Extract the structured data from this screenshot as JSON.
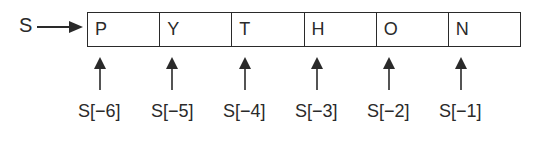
{
  "variable": {
    "name": "S"
  },
  "string_cells": [
    {
      "char": "P",
      "index_label": "S[−6]"
    },
    {
      "char": "Y",
      "index_label": "S[−5]"
    },
    {
      "char": "T",
      "index_label": "S[−4]"
    },
    {
      "char": "H",
      "index_label": "S[−3]"
    },
    {
      "char": "O",
      "index_label": "S[−2]"
    },
    {
      "char": "N",
      "index_label": "S[−1]"
    }
  ],
  "colors": {
    "line": "#2a2a2a",
    "background": "#ffffff"
  }
}
